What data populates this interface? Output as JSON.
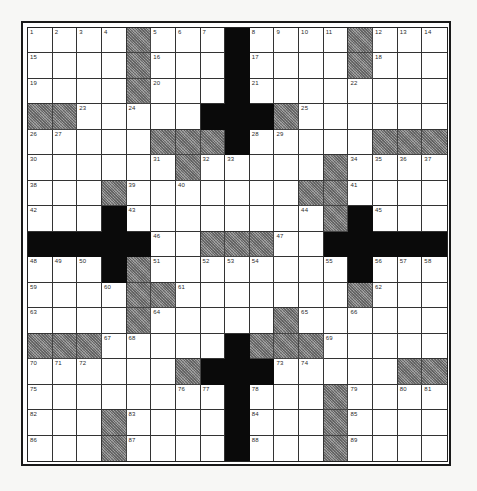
{
  "puzzle": {
    "type": "crossword",
    "size": {
      "rows": 17,
      "cols": 17
    },
    "legend": {
      ".": "white-cell",
      "#": "black-cell",
      "g": "shaded-cell"
    },
    "colors": {
      "white": "#ffffff",
      "black": "#0a0a0a",
      "shaded": "#8c8c8c",
      "grid_line": "#333333"
    },
    "rows": [
      "....g...#....g...",
      "....g...#....g...",
      "....g...#........",
      "gg.....###g......",
      ".....ggg#.....ggg",
      "......g.....g....",
      "...g.......gg....",
      "...#........g#...",
      "#####..ggg..#####",
      "...#g........#...",
      "....gg.......g...",
      "....g.....g......",
      "ggg.....#ggg.....",
      "......g###.....gg",
      "........#...g....",
      "...g....#...g....",
      "...g....#...g...."
    ],
    "numbers": [
      {
        "r": 0,
        "c": 0,
        "n": "1"
      },
      {
        "r": 0,
        "c": 1,
        "n": "2"
      },
      {
        "r": 0,
        "c": 2,
        "n": "3"
      },
      {
        "r": 0,
        "c": 3,
        "n": "4"
      },
      {
        "r": 0,
        "c": 5,
        "n": "5"
      },
      {
        "r": 0,
        "c": 6,
        "n": "6"
      },
      {
        "r": 0,
        "c": 7,
        "n": "7"
      },
      {
        "r": 0,
        "c": 9,
        "n": "8"
      },
      {
        "r": 0,
        "c": 10,
        "n": "9"
      },
      {
        "r": 0,
        "c": 11,
        "n": "10"
      },
      {
        "r": 0,
        "c": 12,
        "n": "11"
      },
      {
        "r": 0,
        "c": 14,
        "n": "12"
      },
      {
        "r": 0,
        "c": 15,
        "n": "13"
      },
      {
        "r": 0,
        "c": 16,
        "n": "14"
      },
      {
        "r": 1,
        "c": 0,
        "n": "15"
      },
      {
        "r": 1,
        "c": 5,
        "n": "16"
      },
      {
        "r": 1,
        "c": 9,
        "n": "17"
      },
      {
        "r": 1,
        "c": 14,
        "n": "18"
      },
      {
        "r": 2,
        "c": 0,
        "n": "19"
      },
      {
        "r": 2,
        "c": 5,
        "n": "20"
      },
      {
        "r": 2,
        "c": 9,
        "n": "21"
      },
      {
        "r": 2,
        "c": 13,
        "n": "22"
      },
      {
        "r": 3,
        "c": 2,
        "n": "23"
      },
      {
        "r": 3,
        "c": 4,
        "n": "24"
      },
      {
        "r": 3,
        "c": 11,
        "n": "25"
      },
      {
        "r": 4,
        "c": 0,
        "n": "26"
      },
      {
        "r": 4,
        "c": 1,
        "n": "27"
      },
      {
        "r": 4,
        "c": 9,
        "n": "28"
      },
      {
        "r": 4,
        "c": 10,
        "n": "29"
      },
      {
        "r": 5,
        "c": 0,
        "n": "30"
      },
      {
        "r": 5,
        "c": 5,
        "n": "31"
      },
      {
        "r": 5,
        "c": 7,
        "n": "32"
      },
      {
        "r": 5,
        "c": 8,
        "n": "33"
      },
      {
        "r": 5,
        "c": 13,
        "n": "34"
      },
      {
        "r": 5,
        "c": 14,
        "n": "35"
      },
      {
        "r": 5,
        "c": 15,
        "n": "36"
      },
      {
        "r": 5,
        "c": 16,
        "n": "37"
      },
      {
        "r": 6,
        "c": 0,
        "n": "38"
      },
      {
        "r": 6,
        "c": 4,
        "n": "39"
      },
      {
        "r": 6,
        "c": 6,
        "n": "40"
      },
      {
        "r": 6,
        "c": 13,
        "n": "41"
      },
      {
        "r": 7,
        "c": 0,
        "n": "42"
      },
      {
        "r": 7,
        "c": 4,
        "n": "43"
      },
      {
        "r": 7,
        "c": 11,
        "n": "44"
      },
      {
        "r": 7,
        "c": 14,
        "n": "45"
      },
      {
        "r": 8,
        "c": 5,
        "n": "46"
      },
      {
        "r": 8,
        "c": 10,
        "n": "47"
      },
      {
        "r": 9,
        "c": 0,
        "n": "48"
      },
      {
        "r": 9,
        "c": 1,
        "n": "49"
      },
      {
        "r": 9,
        "c": 2,
        "n": "50"
      },
      {
        "r": 9,
        "c": 5,
        "n": "51"
      },
      {
        "r": 9,
        "c": 7,
        "n": "52"
      },
      {
        "r": 9,
        "c": 8,
        "n": "53"
      },
      {
        "r": 9,
        "c": 9,
        "n": "54"
      },
      {
        "r": 9,
        "c": 12,
        "n": "55"
      },
      {
        "r": 9,
        "c": 14,
        "n": "56"
      },
      {
        "r": 9,
        "c": 15,
        "n": "57"
      },
      {
        "r": 9,
        "c": 16,
        "n": "58"
      },
      {
        "r": 10,
        "c": 0,
        "n": "59"
      },
      {
        "r": 10,
        "c": 3,
        "n": "60"
      },
      {
        "r": 10,
        "c": 6,
        "n": "61"
      },
      {
        "r": 10,
        "c": 14,
        "n": "62"
      },
      {
        "r": 11,
        "c": 0,
        "n": "63"
      },
      {
        "r": 11,
        "c": 5,
        "n": "64"
      },
      {
        "r": 11,
        "c": 11,
        "n": "65"
      },
      {
        "r": 11,
        "c": 13,
        "n": "66"
      },
      {
        "r": 12,
        "c": 3,
        "n": "67"
      },
      {
        "r": 12,
        "c": 4,
        "n": "68"
      },
      {
        "r": 12,
        "c": 12,
        "n": "69"
      },
      {
        "r": 13,
        "c": 0,
        "n": "70"
      },
      {
        "r": 13,
        "c": 1,
        "n": "71"
      },
      {
        "r": 13,
        "c": 2,
        "n": "72"
      },
      {
        "r": 13,
        "c": 10,
        "n": "73"
      },
      {
        "r": 13,
        "c": 11,
        "n": "74"
      },
      {
        "r": 14,
        "c": 0,
        "n": "75"
      },
      {
        "r": 14,
        "c": 6,
        "n": "76"
      },
      {
        "r": 14,
        "c": 7,
        "n": "77"
      },
      {
        "r": 14,
        "c": 9,
        "n": "78"
      },
      {
        "r": 14,
        "c": 13,
        "n": "79"
      },
      {
        "r": 14,
        "c": 15,
        "n": "80"
      },
      {
        "r": 14,
        "c": 16,
        "n": "81"
      },
      {
        "r": 15,
        "c": 0,
        "n": "82"
      },
      {
        "r": 15,
        "c": 4,
        "n": "83"
      },
      {
        "r": 15,
        "c": 9,
        "n": "84"
      },
      {
        "r": 15,
        "c": 13,
        "n": "85"
      },
      {
        "r": 16,
        "c": 0,
        "n": "86"
      },
      {
        "r": 16,
        "c": 4,
        "n": "87"
      },
      {
        "r": 16,
        "c": 9,
        "n": "88"
      },
      {
        "r": 16,
        "c": 13,
        "n": "89"
      }
    ]
  }
}
